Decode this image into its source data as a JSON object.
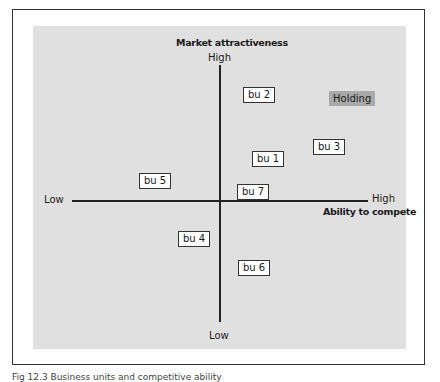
{
  "figure": {
    "y_axis": {
      "title": "Market attractiveness",
      "high": "High",
      "low": "Low"
    },
    "x_axis": {
      "title": "Ability to compete",
      "high": "High",
      "low": "Low"
    },
    "business_units": [
      {
        "label": "bu 1"
      },
      {
        "label": "bu 2"
      },
      {
        "label": "bu 3"
      },
      {
        "label": "bu 4"
      },
      {
        "label": "bu 5"
      },
      {
        "label": "bu 6"
      },
      {
        "label": "bu 7"
      }
    ],
    "holding_label": "Holding",
    "colors": {
      "panel": "#e0e0e0",
      "holding": "#a9a9a9",
      "axis": "#222222"
    }
  },
  "caption": "Fig 12.3 Business units and competitive ability"
}
